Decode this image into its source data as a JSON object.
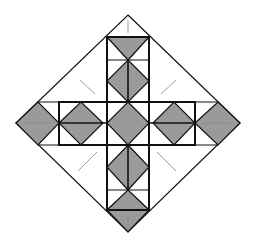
{
  "diagram": {
    "colors": {
      "background": "#ffffff",
      "line": "#111111",
      "fill": "#9a9a9a",
      "guide": "#888888"
    },
    "outer_diamond": {
      "top": [
        128,
        15
      ],
      "right": [
        240,
        123
      ],
      "bottom": [
        128,
        232
      ],
      "left": [
        16,
        123
      ]
    },
    "cross": {
      "vertical_arm": {
        "x1": 107,
        "x2": 149,
        "y1": 37,
        "y2": 210
      },
      "horizontal_arm": {
        "x1": 59,
        "x2": 195,
        "y1": 102,
        "y2": 145
      }
    }
  }
}
